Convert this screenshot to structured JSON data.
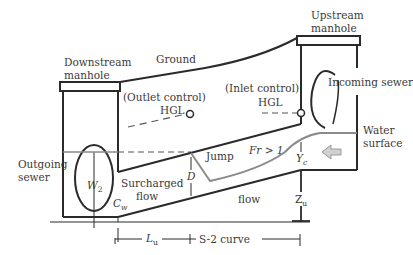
{
  "diagram": {
    "labels": {
      "downstream_manhole_1": "Downstream",
      "downstream_manhole_2": "manhole",
      "ground": "Ground",
      "upstream_manhole_1": "Upstream",
      "upstream_manhole_2": "manhole",
      "outlet_control": "(Outlet control)",
      "outlet_hgl": "HGL",
      "inlet_control": "(Inlet control)",
      "inlet_hgl": "HGL",
      "incoming_sewer": "Incoming sewer",
      "outgoing_sewer_1": "Outgoing",
      "outgoing_sewer_2": "sewer",
      "water_surface_1": "Water",
      "water_surface_2": "surface",
      "jump": "Jump",
      "froude": "Fr > 1",
      "surcharged_1": "Surcharged",
      "surcharged_2": "flow",
      "flow": "flow",
      "w2_main": "W",
      "w2_sub": "2",
      "cw_main": "C",
      "cw_sub": "w",
      "d": "D",
      "yc_main": "Y",
      "yc_sub": "c",
      "zu_main": "Z",
      "zu_sub": "u",
      "lu_main": "L",
      "lu_sub": "u",
      "s2_curve": "S-2 curve"
    },
    "colors": {
      "line": "#2a2a2a",
      "water": "#8a8a8a",
      "arrow_fill": "#d0d0d0",
      "arrow_stroke": "#9a9a9a",
      "text": "#3a3a3a"
    }
  }
}
